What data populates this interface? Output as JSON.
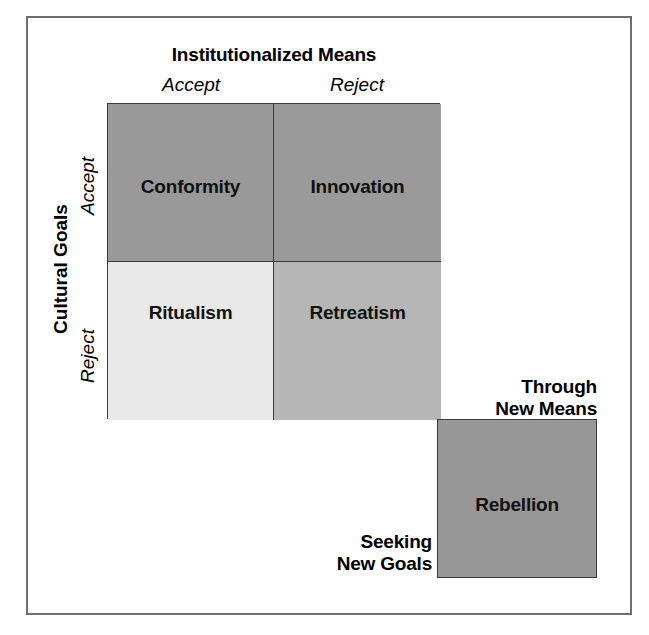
{
  "figure": {
    "type": "2x2-matrix-diagram",
    "title_x_axis": "Institutionalized Means",
    "title_y_axis": "Cultural Goals",
    "columns": [
      {
        "key": "accept",
        "label": "Accept"
      },
      {
        "key": "reject",
        "label": "Reject"
      }
    ],
    "rows": [
      {
        "key": "accept",
        "label": "Accept"
      },
      {
        "key": "reject",
        "label": "Reject"
      }
    ],
    "cells": [
      {
        "key": "conformity",
        "label": "Conformity",
        "row": "Accept",
        "column": "Accept",
        "fill": "#999999"
      },
      {
        "key": "innovation",
        "label": "Innovation",
        "row": "Accept",
        "column": "Reject",
        "fill": "#9a9a9a"
      },
      {
        "key": "ritualism",
        "label": "Ritualism",
        "row": "Reject",
        "column": "Accept",
        "fill": "#e9e9e9"
      },
      {
        "key": "retreatism",
        "label": "Retreatism",
        "row": "Reject",
        "column": "Reject",
        "fill": "#b6b6b6"
      }
    ],
    "extra_cell": {
      "key": "rebellion",
      "label": "Rebellion",
      "fill": "#979797"
    },
    "annotations": {
      "through_new_means": {
        "line1": "Through",
        "line2": "New Means"
      },
      "seeking_new_goals": {
        "line1": "Seeking",
        "line2": "New Goals"
      }
    },
    "colors": {
      "frame": "#6e6e6e",
      "cell_border": "#3a3a3a",
      "text": "#111111",
      "background": "#ffffff"
    }
  }
}
